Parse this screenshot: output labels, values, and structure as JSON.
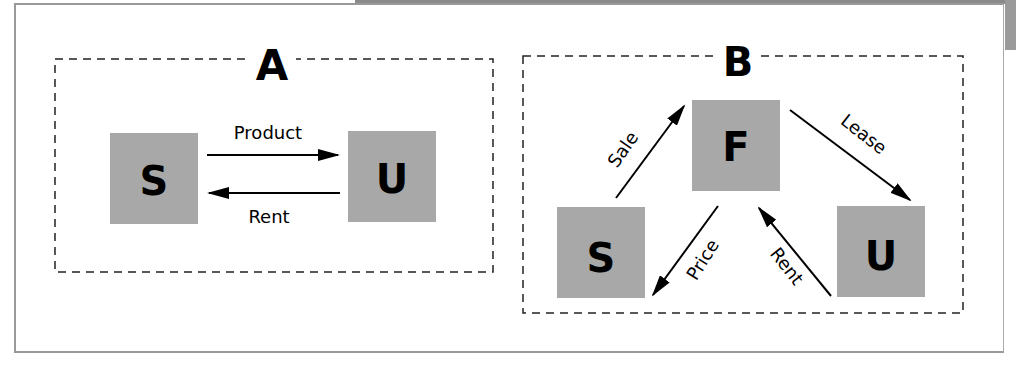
{
  "diagrams": {
    "a": {
      "title": "A",
      "nodes": {
        "s": "S",
        "u": "U"
      },
      "edges": {
        "product": "Product",
        "rent": "Rent"
      }
    },
    "b": {
      "title": "B",
      "nodes": {
        "f": "F",
        "s": "S",
        "u": "U"
      },
      "edges": {
        "sale": "Sale",
        "lease": "Lease",
        "price": "Price",
        "rent": "Rent"
      }
    }
  },
  "colors": {
    "node_fill": "#a8a8a8",
    "line": "#000000",
    "frame": "#999999"
  }
}
